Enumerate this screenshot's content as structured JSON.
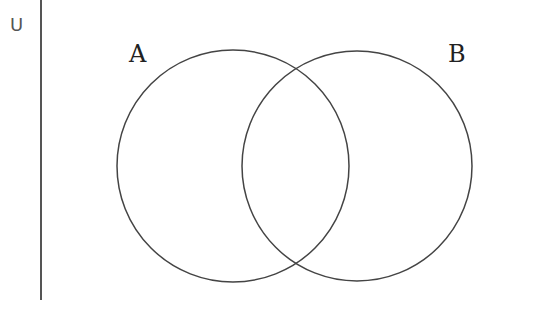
{
  "diagram": {
    "type": "venn",
    "universe_symbol": "U",
    "sets": [
      {
        "label": "A",
        "cx": 233,
        "cy": 166,
        "r": 116
      },
      {
        "label": "B",
        "cx": 357,
        "cy": 166,
        "r": 115
      }
    ],
    "stroke_color": "#444444"
  }
}
